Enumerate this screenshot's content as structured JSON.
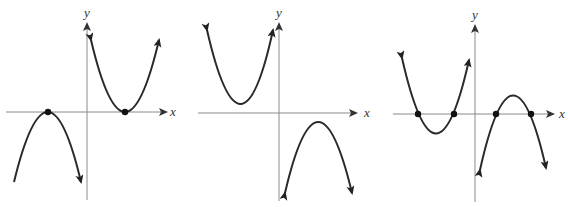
{
  "figure": {
    "panels": [
      {
        "id": "graph-1",
        "x_label": "x",
        "y_label": "y",
        "origin": [
          87,
          112
        ],
        "curves": [
          {
            "type": "downward-parabola",
            "vertex": [
              48,
              112
            ],
            "vertex_on_x_axis": true,
            "left_tip": [
              14,
              182
            ],
            "right_tip": [
              81,
              182
            ]
          },
          {
            "type": "upward-parabola",
            "vertex": [
              125,
              112
            ],
            "vertex_on_x_axis": true,
            "left_tip": [
              91,
              40
            ],
            "right_tip": [
              159,
              40
            ]
          }
        ],
        "marked_points": [
          [
            48,
            112
          ],
          [
            125,
            112
          ]
        ]
      },
      {
        "id": "graph-2",
        "x_label": "x",
        "y_label": "y",
        "origin": [
          279,
          113
        ],
        "curves": [
          {
            "type": "upward-parabola",
            "vertex": [
              241,
              104
            ],
            "left_tip": [
              207,
              30
            ],
            "right_tip": [
              273,
              30
            ]
          },
          {
            "type": "downward-parabola",
            "vertex": [
              318,
              122
            ],
            "left_tip": [
              285,
              193
            ],
            "right_tip": [
              352,
              193
            ]
          }
        ],
        "marked_points": []
      },
      {
        "id": "graph-3",
        "x_label": "x",
        "y_label": "y",
        "origin": [
          475,
          114
        ],
        "curves": [
          {
            "type": "upward-parabola",
            "vertex": [
              436,
              133
            ],
            "roots": [
              418,
              454
            ],
            "left_tip": [
              402,
              58
            ],
            "right_tip": [
              469,
              60
            ]
          },
          {
            "type": "downward-parabola",
            "vertex": [
              513,
              96
            ],
            "roots": [
              496,
              531
            ],
            "left_tip": [
              480,
              170
            ],
            "right_tip": [
              546,
              168
            ]
          }
        ],
        "marked_points": [
          [
            418,
            114
          ],
          [
            454,
            114
          ],
          [
            496,
            114
          ],
          [
            531,
            114
          ]
        ]
      }
    ]
  }
}
